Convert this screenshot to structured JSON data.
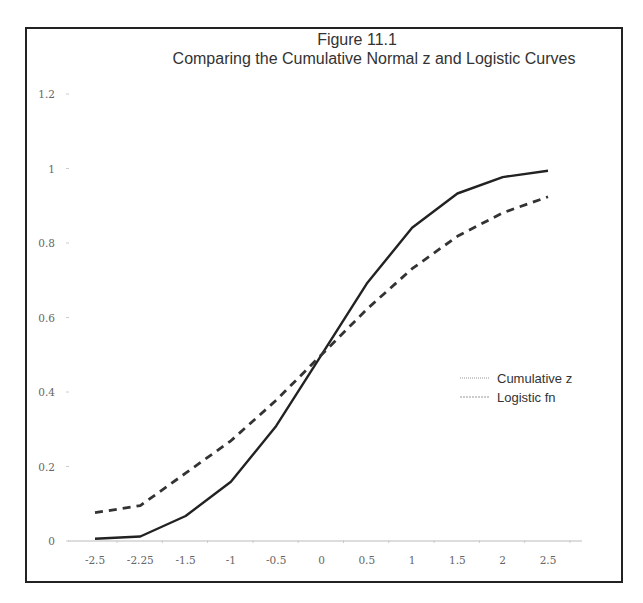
{
  "chart_data": {
    "type": "line",
    "title": "Figure 11.1",
    "subtitle": "Comparing the Cumulative Normal z and Logistic Curves",
    "xlabel": "",
    "ylabel": "",
    "categories": [
      "-2.5",
      "-2.25",
      "-1.5",
      "-1",
      "-0.5",
      "0",
      "0.5",
      "1",
      "1.5",
      "2",
      "2.5"
    ],
    "x": [
      -2.5,
      -2.25,
      -1.5,
      -1,
      -0.5,
      0,
      0.5,
      1,
      1.5,
      2,
      2.5
    ],
    "series": [
      {
        "name": "Cumulative z",
        "style": "solid",
        "color": "#222222",
        "values": [
          0.006,
          0.012,
          0.067,
          0.159,
          0.309,
          0.5,
          0.691,
          0.841,
          0.933,
          0.977,
          0.994
        ]
      },
      {
        "name": "Logistic fn",
        "style": "dashed",
        "color": "#333333",
        "values": [
          0.076,
          0.095,
          0.182,
          0.269,
          0.378,
          0.5,
          0.622,
          0.731,
          0.818,
          0.881,
          0.924
        ]
      }
    ],
    "ylim": [
      0,
      1.2
    ],
    "yticks": [
      "0",
      "0.2",
      "0.4",
      "0.6",
      "0.8",
      "1",
      "1.2"
    ],
    "grid": false,
    "legend_position": "right-middle"
  },
  "figure": {
    "title": "Figure 11.1",
    "subtitle": "Comparing the Cumulative Normal z and Logistic Curves"
  },
  "legend": [
    {
      "label": "Cumulative z"
    },
    {
      "label": "Logistic fn"
    }
  ],
  "axes": {
    "x_ticks": [
      "-2.5",
      "-2.25",
      "-1.5",
      "-1",
      "-0.5",
      "0",
      "0.5",
      "1",
      "1.5",
      "2",
      "2.5"
    ],
    "y_ticks": [
      "0",
      "0.2",
      "0.4",
      "0.6",
      "0.8",
      "1",
      "1.2"
    ]
  }
}
